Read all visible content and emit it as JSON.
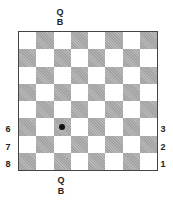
{
  "top_labels": {
    "line1": "Q",
    "line2": "B"
  },
  "bottom_labels": {
    "line1": "Q",
    "line2": "B"
  },
  "left_labels": [
    "6",
    "7",
    "8"
  ],
  "right_labels": [
    "3",
    "2",
    "1"
  ],
  "board": {
    "size": 8,
    "light_color": "#ffffff",
    "dark_color": "#b8b8b8",
    "marker": {
      "row": 5,
      "col": 2,
      "type": "dot",
      "color": "#111111"
    }
  }
}
